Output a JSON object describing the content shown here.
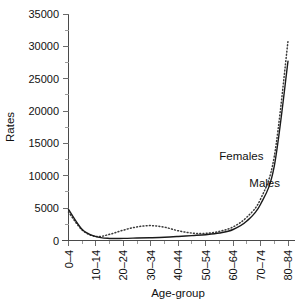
{
  "chart_data": {
    "type": "line",
    "title": "",
    "xlabel": "Age-group",
    "ylabel": "Rates",
    "grid": false,
    "legend_position": "inline-annotations",
    "ylim": [
      0,
      35000
    ],
    "ytick_labels": [
      "0",
      "5000",
      "10000",
      "15000",
      "20000",
      "25000",
      "30000",
      "35000"
    ],
    "ytick_values": [
      0,
      5000,
      10000,
      15000,
      20000,
      25000,
      30000,
      35000
    ],
    "categories": [
      "0-4",
      "5-9",
      "10-14",
      "15-19",
      "20-24",
      "25-29",
      "30-34",
      "35-39",
      "40-44",
      "45-49",
      "50-54",
      "55-59",
      "60-64",
      "65-69",
      "70-74",
      "75-79",
      "80-84"
    ],
    "xtick_labels_shown": [
      "0–4",
      "10–14",
      "20–24",
      "30–34",
      "40–44",
      "50–54",
      "60–64",
      "70–74",
      "80–84"
    ],
    "xtick_label_indices": [
      0,
      2,
      4,
      6,
      8,
      10,
      12,
      14,
      16
    ],
    "series": [
      {
        "name": "Males",
        "style": "solid",
        "label_text": "Males",
        "values": [
          4800,
          1700,
          600,
          320,
          330,
          380,
          430,
          500,
          620,
          760,
          900,
          1150,
          1700,
          3000,
          5600,
          11500,
          27700
        ]
      },
      {
        "name": "Females",
        "style": "dotted",
        "label_text": "Females",
        "values": [
          4400,
          1600,
          620,
          950,
          1600,
          2100,
          2300,
          2050,
          1500,
          1150,
          1100,
          1400,
          2100,
          3600,
          6400,
          13000,
          30800
        ]
      }
    ],
    "annotations": [
      {
        "text": "Females",
        "x_index": 12.6,
        "y_value": 12400
      },
      {
        "text": "Males",
        "x_index": 14.3,
        "y_value": 8200
      }
    ]
  }
}
